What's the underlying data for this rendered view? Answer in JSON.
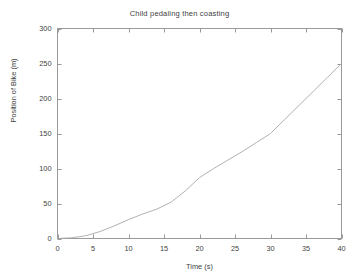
{
  "chart_data": {
    "type": "line",
    "title": "Child pedaling then coasting",
    "xlabel": "Time (s)",
    "ylabel": "Position of Bike (m)",
    "xlim": [
      0,
      40
    ],
    "ylim": [
      0,
      300
    ],
    "xticks": [
      0,
      5,
      10,
      15,
      20,
      25,
      30,
      35,
      40
    ],
    "yticks": [
      0,
      50,
      100,
      150,
      200,
      250,
      300
    ],
    "xtick_labels": [
      "0",
      "5",
      "10",
      "15",
      "20",
      "25",
      "30",
      "35",
      "40"
    ],
    "ytick_labels": [
      "0",
      "50",
      "100",
      "150",
      "200",
      "250",
      "300"
    ],
    "grid": false,
    "legend": "none",
    "series": [
      {
        "name": "Position of Bike",
        "color": "#a8a8a8",
        "x": [
          0,
          2,
          4,
          6,
          8,
          10,
          12,
          14,
          16,
          18,
          20,
          22,
          24,
          26,
          28,
          30,
          32,
          34,
          36,
          38,
          40
        ],
        "y": [
          0,
          1,
          4,
          10,
          18,
          27,
          35,
          42,
          52,
          68,
          87,
          100,
          112,
          124,
          137,
          150,
          170,
          190,
          210,
          230,
          250
        ]
      }
    ],
    "annotations": [
      "Curve is concave-up (accelerating while pedaling) from 0 s to about 30 s, reaching roughly 150 m.",
      "Curve becomes nearly straight (constant speed coasting) from about 30 s to 40 s, ending near 250 m."
    ]
  },
  "axes": {
    "frame_color": "#9a9a9a",
    "tick_color": "#9a9a9a",
    "background": "#ffffff"
  }
}
